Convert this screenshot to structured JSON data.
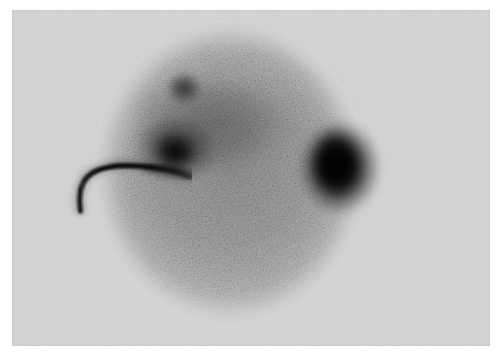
{
  "image": {
    "modality": "scintigraphy",
    "title": "Planar gamma camera scintigram",
    "description": "Grayscale nuclear medicine planar scintigram showing a circular detector field of view filled with Poisson counting speckle, a dense focal area of high tracer uptake on the right, a broader moderate uptake region in the upper left, and a thin curved linear tracer-filled tube entering from the left edge.",
    "view_label": "",
    "orientation_label": "",
    "caption": "",
    "background_color": "#ffffff",
    "film_color": "#d5d5d5",
    "field_color": "#9b9b9b",
    "hotspot_color": "#0a0a0a"
  },
  "panel": {
    "x": 12,
    "y": 10,
    "width": 478,
    "height": 336
  },
  "field_of_view": {
    "shape": "circle",
    "center_x": 218,
    "center_y": 164,
    "radius_x": 140,
    "radius_y": 156
  },
  "features": [
    {
      "name": "focal-hot-spot-right",
      "label": "",
      "intensity": "very high",
      "center_x": 330,
      "center_y": 151,
      "width": 108,
      "height": 130
    },
    {
      "name": "diffuse-uptake-upper-left",
      "label": "",
      "intensity": "moderate",
      "center_x": 167,
      "center_y": 138,
      "width": 98,
      "height": 84
    },
    {
      "name": "focal-uptake-upper-left",
      "label": "",
      "intensity": "high",
      "center_x": 163,
      "center_y": 142,
      "width": 46,
      "height": 40
    },
    {
      "name": "small-focus-superior",
      "label": "",
      "intensity": "moderate",
      "center_x": 172,
      "center_y": 78,
      "width": 44,
      "height": 40
    },
    {
      "name": "linear-tube-tracer",
      "label": "",
      "intensity": "very high",
      "center_x": 115,
      "center_y": 169,
      "width": 130,
      "height": 82
    }
  ],
  "annotations": [],
  "labels": []
}
